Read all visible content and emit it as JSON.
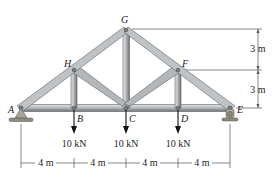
{
  "diagram": {
    "type": "roof truss",
    "nodes": {
      "A": {
        "label": "A",
        "x": 21,
        "y": 108
      },
      "B": {
        "label": "B",
        "x": 74,
        "y": 108
      },
      "C": {
        "label": "C",
        "x": 126,
        "y": 108
      },
      "D": {
        "label": "D",
        "x": 178,
        "y": 108
      },
      "E": {
        "label": "E",
        "x": 230,
        "y": 108
      },
      "F": {
        "label": "F",
        "x": 178,
        "y": 70
      },
      "G": {
        "label": "G",
        "x": 126,
        "y": 31
      },
      "H": {
        "label": "H",
        "x": 74,
        "y": 70
      }
    },
    "members": [
      [
        "A",
        "B"
      ],
      [
        "B",
        "C"
      ],
      [
        "C",
        "D"
      ],
      [
        "D",
        "E"
      ],
      [
        "A",
        "H"
      ],
      [
        "H",
        "G"
      ],
      [
        "G",
        "F"
      ],
      [
        "F",
        "E"
      ],
      [
        "H",
        "B"
      ],
      [
        "G",
        "C"
      ],
      [
        "F",
        "D"
      ],
      [
        "H",
        "C"
      ],
      [
        "F",
        "C"
      ]
    ],
    "supports": {
      "A": "pin",
      "E": "roller"
    },
    "loads": [
      {
        "node": "B",
        "label": "10 kN"
      },
      {
        "node": "C",
        "label": "10 kN"
      },
      {
        "node": "D",
        "label": "10 kN"
      }
    ],
    "horizontal_dimensions": [
      "4 m",
      "4 m",
      "4 m",
      "4 m"
    ],
    "vertical_dimensions": [
      "3 m",
      "3 m"
    ],
    "colors": {
      "member_fill": "#b9bcbf",
      "member_edge": "#5f6366",
      "member_highlight": "#e4e6e8",
      "support": "#8f8a80",
      "arrow": "#111111",
      "dimension_line": "#555555"
    }
  }
}
